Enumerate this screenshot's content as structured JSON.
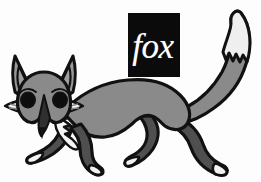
{
  "artwork": {
    "title": "fox",
    "subject": "stylized walking fox illustration",
    "background_color": "#fdfdfd",
    "canvas": {
      "width": 261,
      "height": 182
    }
  },
  "logo": {
    "word": "fox",
    "box_color": "#0b0b0b",
    "text_color": "#ffffff",
    "box": {
      "x": 128,
      "y": 13,
      "width": 52,
      "height": 64
    }
  },
  "palette": {
    "outline": "#111111",
    "body_gray": "#8a8a8a",
    "ear_inner_gray": "#9a9a9a",
    "leg_dark_gray": "#4f4f4f",
    "muzzle_dark": "#3a3a3a",
    "eye_black": "#0d0d0d",
    "fur_white": "#f4f4f4",
    "tail_tip_white": "#efefef",
    "background": "#fdfdfd"
  },
  "parts": [
    {
      "name": "tail",
      "color": "#8a8a8a",
      "note": "long plume curving up to top right"
    },
    {
      "name": "tail-tip",
      "color": "#efefef",
      "note": "white tip with zigzag boundary"
    },
    {
      "name": "body",
      "color": "#8a8a8a",
      "note": "arched torso from shoulder to hip"
    },
    {
      "name": "head",
      "color": "#8a8a8a",
      "note": "facing viewer, pointed muzzle down-left"
    },
    {
      "name": "ear-left",
      "color": "#9a9a9a",
      "note": "tall triangular ear"
    },
    {
      "name": "ear-right",
      "color": "#9a9a9a",
      "note": "tall triangular ear"
    },
    {
      "name": "eye-left",
      "color": "#0d0d0d",
      "note": "round black eye"
    },
    {
      "name": "eye-right",
      "color": "#0d0d0d",
      "note": "round black eye"
    },
    {
      "name": "muzzle",
      "color": "#3a3a3a",
      "note": "dark narrow snout wedge"
    },
    {
      "name": "cheek-ruff-left",
      "color": "#f4f4f4",
      "note": "white fur flare"
    },
    {
      "name": "cheek-ruff-right",
      "color": "#f4f4f4",
      "note": "white fur flare"
    },
    {
      "name": "chest-ruff",
      "color": "#f4f4f4",
      "note": "white spiky chest fur"
    },
    {
      "name": "foreleg-front",
      "color": "#4f4f4f",
      "note": "dark front leg, white paw"
    },
    {
      "name": "foreleg-back",
      "color": "#4f4f4f",
      "note": "dark front leg, white paw"
    },
    {
      "name": "hindleg-front",
      "color": "#4f4f4f",
      "note": "dark rear leg, white paw"
    },
    {
      "name": "hindleg-back",
      "color": "#4f4f4f",
      "note": "dark rear leg, white paw"
    }
  ]
}
